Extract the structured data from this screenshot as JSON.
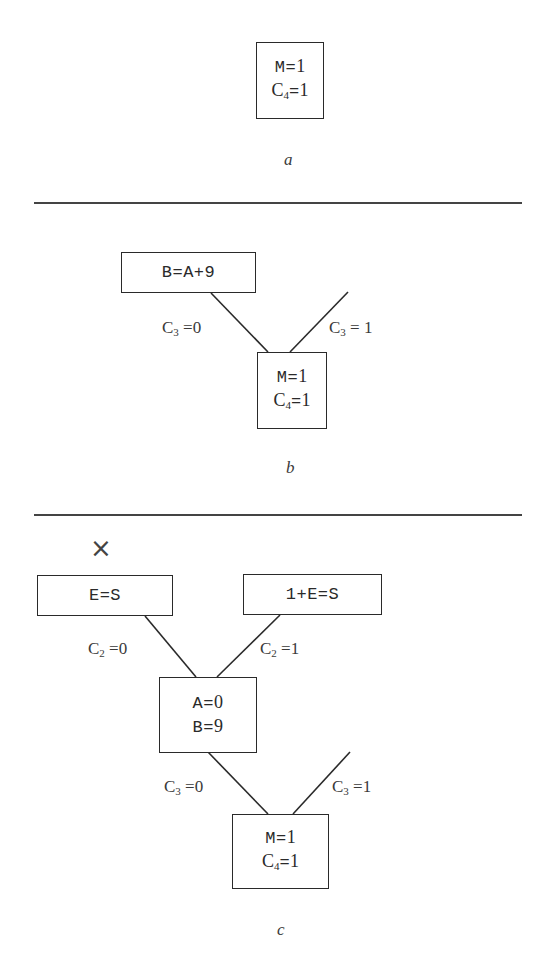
{
  "panels": [
    {
      "id": "a",
      "caption": "a",
      "nodes": [
        {
          "id": "a-root",
          "lines": [
            {
              "var": "M",
              "val": "1"
            },
            {
              "var": "C",
              "sub": "4",
              "val": "1"
            }
          ]
        }
      ]
    },
    {
      "id": "b",
      "caption": "b",
      "nodes": [
        {
          "id": "b-child",
          "text": "B=A+9"
        },
        {
          "id": "b-root",
          "lines": [
            {
              "var": "M",
              "val": "1"
            },
            {
              "var": "C",
              "sub": "4",
              "val": "1"
            }
          ]
        }
      ],
      "edges": [
        {
          "label_var": "C",
          "label_sub": "3",
          "label_val": "0"
        },
        {
          "label_var": "C",
          "label_sub": "3",
          "label_val": "1"
        }
      ]
    },
    {
      "id": "c",
      "caption": "c",
      "failure_mark": "×",
      "nodes": [
        {
          "id": "c-left",
          "text": "E=S",
          "failed": true
        },
        {
          "id": "c-right",
          "text": "1+E=S"
        },
        {
          "id": "c-mid",
          "lines": [
            {
              "var": "A",
              "val": "0"
            },
            {
              "var": "B",
              "val": "9"
            }
          ]
        },
        {
          "id": "c-root",
          "lines": [
            {
              "var": "M",
              "val": "1"
            },
            {
              "var": "C",
              "sub": "4",
              "val": "1"
            }
          ]
        }
      ],
      "edges": [
        {
          "label_var": "C",
          "label_sub": "2",
          "label_val": "0"
        },
        {
          "label_var": "C",
          "label_sub": "2",
          "label_val": "1"
        },
        {
          "label_var": "C",
          "label_sub": "3",
          "label_val": "0"
        },
        {
          "label_var": "C",
          "label_sub": "3",
          "label_val": "1"
        }
      ]
    }
  ],
  "eq": "="
}
